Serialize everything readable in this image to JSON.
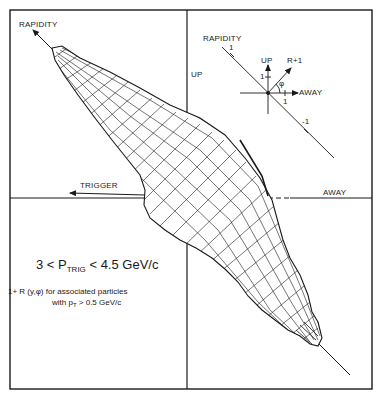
{
  "figure": {
    "axis_labels": {
      "rapidity": "RAPIDITY",
      "up": "UP",
      "trigger": "TRIGGER",
      "away": "AWAY"
    },
    "inset_key": {
      "rapidity": "RAPIDITY",
      "up": "UP",
      "r_plus_1": "R+1",
      "away": "AWAY",
      "phi": "φ",
      "tick_rapidity_pos": "1",
      "tick_rapidity_neg": "-1",
      "tick_up": "1",
      "tick_away": "1"
    },
    "title": {
      "prefix": "3 < P",
      "subscript": "TRIG",
      "suffix": " < 4.5 GeV/c"
    },
    "caption": {
      "line1": "1+ R (y,φ) for associated particles",
      "line2_prefix": "with p",
      "line2_subscript": "T",
      "line2_suffix": " > 0.5 GeV/c"
    },
    "colors": {
      "ink": "#1a1a1a",
      "background": "#ffffff"
    }
  }
}
